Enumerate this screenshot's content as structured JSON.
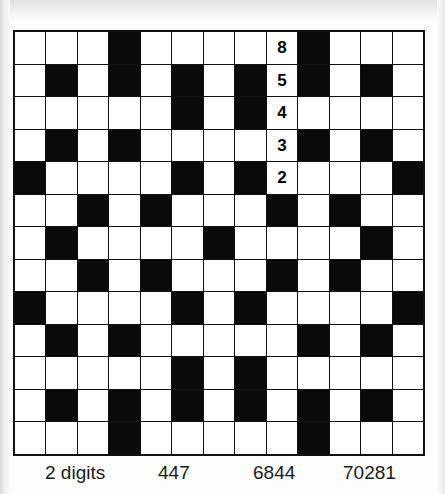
{
  "puzzle": {
    "type": "number-fill-in-crossword",
    "grid": {
      "columns": 13,
      "rows": 13,
      "colors": {
        "blocked": "#0a0a0a",
        "open": "#ffffff",
        "rule": "#111111"
      },
      "legend": {
        "0": "open-cell",
        "1": "blocked-cell"
      },
      "pattern": [
        [
          0,
          0,
          0,
          1,
          0,
          0,
          0,
          0,
          0,
          1,
          0,
          0,
          0
        ],
        [
          0,
          1,
          0,
          1,
          0,
          1,
          0,
          1,
          0,
          1,
          0,
          1,
          0
        ],
        [
          0,
          0,
          0,
          0,
          0,
          1,
          0,
          1,
          0,
          0,
          0,
          0,
          0
        ],
        [
          0,
          1,
          0,
          1,
          0,
          0,
          0,
          0,
          0,
          1,
          0,
          1,
          0
        ],
        [
          1,
          0,
          0,
          0,
          0,
          1,
          0,
          1,
          0,
          0,
          0,
          0,
          1
        ],
        [
          0,
          0,
          1,
          0,
          1,
          0,
          0,
          0,
          1,
          0,
          1,
          0,
          0
        ],
        [
          0,
          1,
          0,
          0,
          0,
          0,
          1,
          0,
          0,
          0,
          0,
          1,
          0
        ],
        [
          0,
          0,
          1,
          0,
          1,
          0,
          0,
          0,
          1,
          0,
          1,
          0,
          0
        ],
        [
          1,
          0,
          0,
          0,
          0,
          1,
          0,
          1,
          0,
          0,
          0,
          0,
          1
        ],
        [
          0,
          1,
          0,
          1,
          0,
          0,
          0,
          0,
          0,
          1,
          0,
          1,
          0
        ],
        [
          0,
          0,
          0,
          0,
          0,
          1,
          0,
          1,
          0,
          0,
          0,
          0,
          0
        ],
        [
          0,
          1,
          0,
          1,
          0,
          1,
          0,
          1,
          0,
          1,
          0,
          1,
          0
        ],
        [
          0,
          0,
          0,
          1,
          0,
          0,
          0,
          0,
          0,
          1,
          0,
          0,
          0
        ]
      ],
      "filled_entries": [
        {
          "row": 0,
          "col": 8,
          "value": "8"
        },
        {
          "row": 1,
          "col": 8,
          "value": "5"
        },
        {
          "row": 2,
          "col": 8,
          "value": "4"
        },
        {
          "row": 3,
          "col": 8,
          "value": "3"
        },
        {
          "row": 4,
          "col": 8,
          "value": "2"
        }
      ],
      "seeded_number_down": "85432"
    }
  },
  "clue_strip": {
    "columns": [
      {
        "heading": "2 digits"
      },
      {
        "heading": "447"
      },
      {
        "heading": "6844"
      },
      {
        "heading": "70281"
      }
    ]
  }
}
